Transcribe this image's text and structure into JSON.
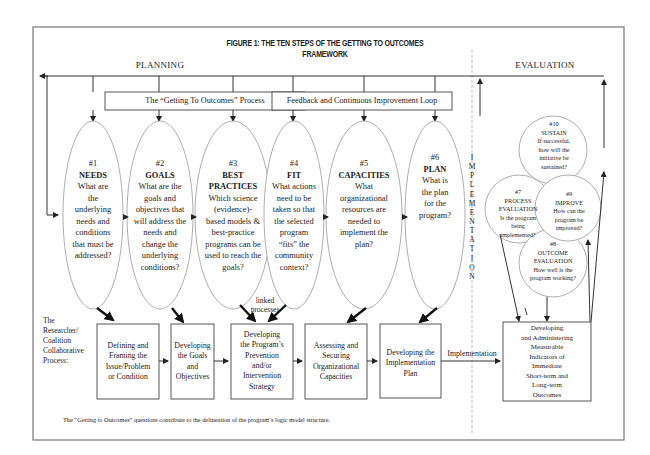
{
  "figure": {
    "title_line1": "FIGURE 1: THE TEN STEPS OF THE GETTING TO OUTCOMES",
    "title_line2": "FRAMEWORK",
    "section_planning": "PLANNING",
    "section_evaluation": "EVALUATION",
    "process_box": "The “Getting To Outcomes” Process",
    "feedback_box": "Feedback and Continuous Improvement Loop",
    "implementation_vertical": [
      "I",
      "M",
      "P",
      "L",
      "E",
      "M",
      "E",
      "N",
      "T",
      "A",
      "T",
      "I",
      "O",
      "N"
    ],
    "linked_processes_1": "linked",
    "linked_processes_2": "processes",
    "collab_label": [
      "The",
      "Researcher/",
      "Coalition",
      "Collaborative",
      "Process:"
    ],
    "implementation_arrow_label": "Implementation",
    "footnote": "The “Getting to Outcomes” questions contribute to the delineation of the program’s logic model structure."
  },
  "planning_steps": [
    {
      "num": "#1",
      "name": "NEEDS",
      "question": [
        "What are",
        "the",
        "underlying",
        "needs and",
        "conditions",
        "that must be",
        "addressed?"
      ]
    },
    {
      "num": "#2",
      "name": "GOALS",
      "question": [
        "What are the",
        "goals and",
        "objectives that",
        "will address the",
        "needs and",
        "change the",
        "underlying",
        "conditions?"
      ]
    },
    {
      "num": "#3",
      "name": "BEST",
      "name2": "PRACTICES",
      "question": [
        "Which science",
        "(evidence)-",
        "based models &",
        "best-practice",
        "programs can be",
        "used to reach the",
        "goals?"
      ]
    },
    {
      "num": "#4",
      "name": "FIT",
      "question": [
        "What actions",
        "need to be",
        "taken so that",
        "the selected",
        "program",
        "“fits” the",
        "community",
        "context?"
      ]
    },
    {
      "num": "#5",
      "name": "CAPACITIES",
      "question": [
        "What",
        "organizational",
        "resources are",
        "needed to",
        "implement the",
        "plan?"
      ]
    },
    {
      "num": "#6",
      "name": "PLAN",
      "question": [
        "What is",
        "the plan",
        "for the",
        "program?"
      ]
    }
  ],
  "evaluation_steps": [
    {
      "num": "#7",
      "name": "PROCESS",
      "name2": "EVALUATION",
      "question": [
        "Is the program",
        "being",
        "implemented?"
      ]
    },
    {
      "num": "#8",
      "name": "OUTCOME",
      "name2": "EVALUATION",
      "question": [
        "How well is the",
        "program working?"
      ]
    },
    {
      "num": "#9",
      "name": "IMPROVE",
      "question": [
        "How can the",
        "program be",
        "improved?"
      ]
    },
    {
      "num": "#10",
      "name": "SUSTAIN",
      "question": [
        "If successful,",
        "how will the",
        "initiative be",
        "sustained?"
      ]
    }
  ],
  "process_boxes": [
    {
      "lines": [
        "Defining and",
        "Framing the",
        "Issue/Problem",
        "or Condition"
      ]
    },
    {
      "lines": [
        "Developing",
        "the Goals",
        "and",
        "Objectives"
      ]
    },
    {
      "lines": [
        "Developing",
        "the Program’s",
        "Prevention",
        "and/or",
        "Intervention",
        "Strategy"
      ]
    },
    {
      "lines": [
        "Assessing and",
        "Securing",
        "Organizational",
        "Capacities"
      ]
    },
    {
      "lines": [
        "Developing the",
        "Implementation",
        "Plan"
      ]
    },
    {
      "lines": [
        "Developing",
        "and Administering",
        "Measurable",
        "Indicators of",
        "Immediate",
        "Short-term and",
        "Long-term",
        "Outcomes"
      ]
    }
  ],
  "colors": {
    "line": "#333333",
    "thin": "#888888",
    "frame": "#777777",
    "dashed": "#bbbbbb"
  }
}
